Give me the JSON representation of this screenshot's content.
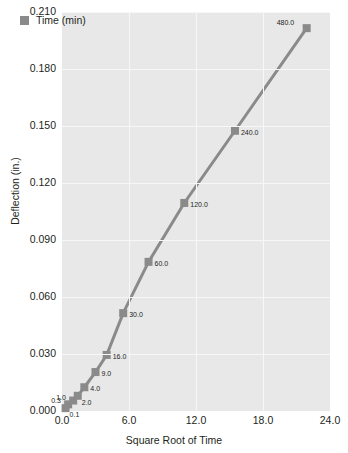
{
  "chart_data": {
    "type": "line",
    "title": "",
    "xlabel": "Square Root of Time",
    "ylabel": "Deflection (in.)",
    "xlim": [
      0,
      24
    ],
    "ylim": [
      0,
      0.21
    ],
    "xticks": [
      "0.0",
      "6.0",
      "12.0",
      "18.0",
      "24.0"
    ],
    "xtick_values": [
      0,
      6,
      12,
      18,
      24
    ],
    "yticks": [
      "0.000",
      "0.030",
      "0.060",
      "0.090",
      "0.120",
      "0.150",
      "0.180",
      "0.210"
    ],
    "ytick_values": [
      0.0,
      0.03,
      0.06,
      0.09,
      0.12,
      0.15,
      0.18,
      0.21
    ],
    "grid": true,
    "legend": {
      "position": "top-left",
      "entries": [
        "Time (min)"
      ]
    },
    "series": [
      {
        "name": "Time (min)",
        "color": "#8a8a8a",
        "marker": "square",
        "point_labels": [
          "0.1",
          "0.3",
          "1.0",
          "2.0",
          "4.0",
          "9.0",
          "16.0",
          "30.0",
          "60.0",
          "120.0",
          "240.0",
          "480.0"
        ],
        "x": [
          0.32,
          0.55,
          1.0,
          1.41,
          2.0,
          3.0,
          4.0,
          5.48,
          7.75,
          10.95,
          15.49,
          21.91
        ],
        "y": [
          0.0015,
          0.0035,
          0.0055,
          0.008,
          0.0125,
          0.0205,
          0.0295,
          0.0515,
          0.0785,
          0.1095,
          0.1475,
          0.2015
        ]
      }
    ]
  },
  "legend": {
    "label": "Time (min)",
    "swatch_color": "#8a8a8a"
  },
  "axes": {
    "x_title": "Square Root of Time",
    "y_title": "Deflection (in.)"
  }
}
